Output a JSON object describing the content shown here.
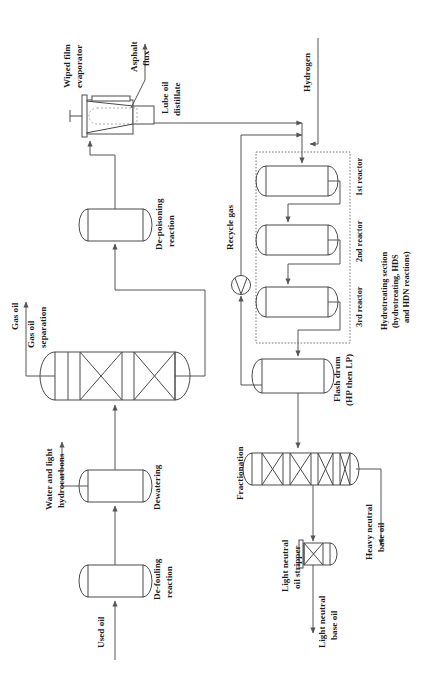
{
  "diagram": {
    "orientation": "labels rotated 90 degrees counter-clockwise",
    "colors": {
      "line": "#555555",
      "vessel_stroke": "#4a4a4a",
      "background": "#ffffff",
      "text": "#1b1b1b"
    },
    "streams": {
      "used_oil": "Used oil",
      "water_and_light_hydrocarbons": "Water and light\nhydrocarbons",
      "gas_oil": "Gas oil",
      "asphalt_flux": "Asphalt\nflux",
      "lube_oil_distillate": "Lube oil\ndistillate",
      "hydrogen": "Hydrogen",
      "recycle_gas": "Recycle gas",
      "heavy_neutral_base_oil": "Heavy neutral\nbase oil",
      "light_neutral_base_oil": "Light neutral\nbase oil"
    },
    "units": {
      "de_fouling": "De-fouling\nreaction",
      "dewatering": "Dewatering",
      "gas_oil_separation": "Gas oil\nseparation",
      "de_poisoning": "De-poisoning\nreaction",
      "wiped_film_evaporator": "Wiped film\nevaporator",
      "reactor_1": "1st reactor",
      "reactor_2": "2nd reactor",
      "reactor_3": "3rd reactor",
      "hydrotreating_section": "Hydrotreating section\n(hydrotreating, HDS\nand HDN reactions)",
      "flash_drum": "Flash drum\n(HP then LP)",
      "fractionation": "Fractionation",
      "light_neutral_oil_stripper": "Light neutral\noil stripper"
    },
    "labels": {
      "used_oil": "Used oil",
      "de_fouling_l1": "De-fouling",
      "de_fouling_l2": "reaction",
      "dewatering": "Dewatering",
      "water_light_l1": "Water and light",
      "water_light_l2": "hydrocarbons",
      "gas_oil_sep_l1": "Gas oil",
      "gas_oil_sep_l2": "separation",
      "gas_oil": "Gas oil",
      "de_poisoning_l1": "De-poisoning",
      "de_poisoning_l2": "reaction",
      "wiped_film_l1": "Wiped film",
      "wiped_film_l2": "evaporator",
      "asphalt_l1": "Asphalt",
      "asphalt_l2": "flux",
      "lube_oil_l1": "Lube oil",
      "lube_oil_l2": "distillate",
      "hydrogen": "Hydrogen",
      "recycle_gas": "Recycle gas",
      "reactor_1": "1st reactor",
      "reactor_2": "2nd reactor",
      "reactor_3": "3rd reactor",
      "hydrotreat_l1": "Hydrotreating section",
      "hydrotreat_l2": "(hydrotreating, HDS",
      "hydrotreat_l3": "and HDN reactions)",
      "flash_drum_l1": "Flash drum",
      "flash_drum_l2": "(HP then LP)",
      "fractionation": "Fractionation",
      "heavy_neutral_l1": "Heavy neutral",
      "heavy_neutral_l2": "base oil",
      "stripper_l1": "Light neutral",
      "stripper_l2": "oil stripper",
      "light_neutral_l1": "Light neutral",
      "light_neutral_l2": "base oil"
    }
  }
}
